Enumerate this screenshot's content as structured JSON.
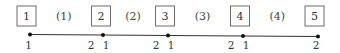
{
  "diagram": {
    "nodes": [
      {
        "label": "1",
        "end_labels": [
          "1"
        ]
      },
      {
        "label": "2",
        "end_labels": [
          "2",
          "1"
        ]
      },
      {
        "label": "3",
        "end_labels": [
          "2",
          "1"
        ]
      },
      {
        "label": "4",
        "end_labels": [
          "2",
          "1"
        ]
      },
      {
        "label": "5",
        "end_labels": [
          "2"
        ]
      }
    ],
    "elements": [
      {
        "label": "(1)"
      },
      {
        "label": "(2)"
      },
      {
        "label": "(3)"
      },
      {
        "label": "(4)"
      }
    ]
  }
}
